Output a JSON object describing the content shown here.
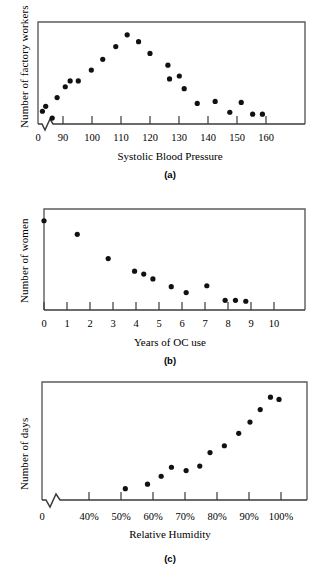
{
  "figure": {
    "panels": [
      {
        "id": "a",
        "caption": "(a)",
        "ylabel": "Number of factory workers",
        "xlabel": "Systolic Blood Pressure",
        "zero_label": "0",
        "axis_break": true,
        "ticks": [
          "90",
          "100",
          "110",
          "120",
          "130",
          "140",
          "150",
          "160"
        ]
      },
      {
        "id": "b",
        "caption": "(b)",
        "ylabel": "Number of women",
        "xlabel": "Years of OC use",
        "zero_label": "0",
        "axis_break": false,
        "ticks": [
          "0",
          "1",
          "2",
          "3",
          "4",
          "5",
          "6",
          "7",
          "8",
          "9",
          "10"
        ]
      },
      {
        "id": "c",
        "caption": "(c)",
        "ylabel": "Number of days",
        "xlabel": "Relative Humidity",
        "zero_label": "0",
        "axis_break": true,
        "ticks": [
          "40%",
          "50%",
          "60%",
          "70%",
          "80%",
          "90%",
          "100%"
        ]
      }
    ]
  },
  "chart_data": [
    {
      "type": "scatter",
      "title": "(a)",
      "xlabel": "Systolic Blood Pressure",
      "ylabel": "Number of factory workers",
      "xlim": [
        85,
        170
      ],
      "ylim": [
        0,
        100
      ],
      "xticks": [
        90,
        100,
        110,
        120,
        130,
        140,
        150,
        160
      ],
      "grid": false,
      "legend": "none",
      "axis_break_x": true,
      "points": [
        {
          "x": 92.5,
          "y": 13
        },
        {
          "x": 93.5,
          "y": 18
        },
        {
          "x": 95.5,
          "y": 6
        },
        {
          "x": 97.0,
          "y": 27
        },
        {
          "x": 99.5,
          "y": 38
        },
        {
          "x": 101.0,
          "y": 44
        },
        {
          "x": 103.5,
          "y": 44
        },
        {
          "x": 107.5,
          "y": 55
        },
        {
          "x": 111.0,
          "y": 66
        },
        {
          "x": 115.0,
          "y": 79
        },
        {
          "x": 118.5,
          "y": 91
        },
        {
          "x": 122.0,
          "y": 84
        },
        {
          "x": 125.5,
          "y": 72
        },
        {
          "x": 131.0,
          "y": 60
        },
        {
          "x": 131.5,
          "y": 46
        },
        {
          "x": 134.5,
          "y": 49
        },
        {
          "x": 136.0,
          "y": 36
        },
        {
          "x": 140.0,
          "y": 21
        },
        {
          "x": 145.5,
          "y": 23
        },
        {
          "x": 150.0,
          "y": 12
        },
        {
          "x": 153.5,
          "y": 22
        },
        {
          "x": 157.0,
          "y": 10
        },
        {
          "x": 160.0,
          "y": 10
        }
      ]
    },
    {
      "type": "scatter",
      "title": "(b)",
      "xlabel": "Years of OC use",
      "ylabel": "Number of women",
      "xlim": [
        0,
        11.6
      ],
      "ylim": [
        0,
        100
      ],
      "xticks": [
        0,
        1,
        2,
        3,
        4,
        5,
        6,
        7,
        8,
        9,
        10
      ],
      "grid": false,
      "legend": "none",
      "axis_break_x": false,
      "points": [
        {
          "x": 0.0,
          "y": 92
        },
        {
          "x": 1.45,
          "y": 78
        },
        {
          "x": 2.8,
          "y": 53
        },
        {
          "x": 3.95,
          "y": 40
        },
        {
          "x": 4.35,
          "y": 37
        },
        {
          "x": 4.75,
          "y": 32
        },
        {
          "x": 5.55,
          "y": 24
        },
        {
          "x": 6.2,
          "y": 18
        },
        {
          "x": 7.1,
          "y": 25
        },
        {
          "x": 7.9,
          "y": 10
        },
        {
          "x": 8.35,
          "y": 10
        },
        {
          "x": 8.8,
          "y": 9
        }
      ]
    },
    {
      "type": "scatter",
      "title": "(c)",
      "xlabel": "Relative Humidity",
      "ylabel": "Number of days",
      "xlim": [
        35,
        112
      ],
      "ylim": [
        0,
        100
      ],
      "xticks": [
        40,
        50,
        60,
        70,
        80,
        90,
        100
      ],
      "xtick_labels": [
        "40%",
        "50%",
        "60%",
        "70%",
        "80%",
        "90%",
        "100%"
      ],
      "grid": false,
      "legend": "none",
      "axis_break_x": true,
      "points": [
        {
          "x": 55.0,
          "y": 10
        },
        {
          "x": 61.5,
          "y": 14
        },
        {
          "x": 65.5,
          "y": 21
        },
        {
          "x": 68.5,
          "y": 29
        },
        {
          "x": 72.8,
          "y": 26
        },
        {
          "x": 76.8,
          "y": 30
        },
        {
          "x": 79.8,
          "y": 42
        },
        {
          "x": 84.0,
          "y": 48
        },
        {
          "x": 88.2,
          "y": 59
        },
        {
          "x": 91.5,
          "y": 69
        },
        {
          "x": 94.5,
          "y": 80
        },
        {
          "x": 97.5,
          "y": 91
        },
        {
          "x": 100.0,
          "y": 89
        }
      ]
    }
  ]
}
